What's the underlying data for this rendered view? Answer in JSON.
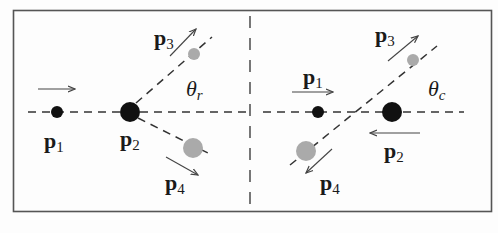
{
  "figure": {
    "colors": {
      "incoming_particle": "#111111",
      "outgoing_particle": "#aaaaaa",
      "line": "#333333",
      "frame": "#555555"
    }
  },
  "left_panel": {
    "frame": "lab",
    "labels": {
      "p1_base": "p",
      "p1_sub": "1",
      "p2_base": "p",
      "p2_sub": "2",
      "p3_base": "p",
      "p3_sub": "3",
      "p4_base": "p",
      "p4_sub": "4",
      "angle_base": "θ",
      "angle_sub": "r"
    }
  },
  "right_panel": {
    "frame": "center-of-mass",
    "labels": {
      "p1_base": "p",
      "p1_sub": "1",
      "p2_base": "p",
      "p2_sub": "2",
      "p3_base": "p",
      "p3_sub": "3",
      "p4_base": "p",
      "p4_sub": "4",
      "angle_base": "θ",
      "angle_sub": "c"
    }
  }
}
